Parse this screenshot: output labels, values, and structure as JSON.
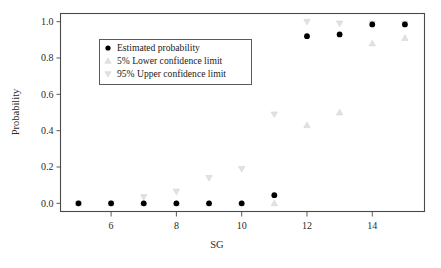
{
  "chart_data": {
    "type": "scatter",
    "title": "",
    "xlabel": "SG",
    "ylabel": "Probability",
    "xlim": [
      4.45,
      15.6
    ],
    "ylim": [
      -0.045,
      1.045
    ],
    "xticks": [
      6,
      8,
      10,
      12,
      14
    ],
    "xtick_labels": [
      "6",
      "8",
      "10",
      "12",
      "14"
    ],
    "yticks": [
      0.0,
      0.2,
      0.4,
      0.6,
      0.8,
      1.0
    ],
    "ytick_labels": [
      "0.0",
      "0.2",
      "0.4",
      "0.6",
      "0.8",
      "1.0"
    ],
    "grid": false,
    "legend_position": "upper left",
    "x": [
      5,
      6,
      7,
      8,
      9,
      10,
      11,
      12,
      13,
      14,
      15
    ],
    "series": [
      {
        "name": "Estimated probability",
        "marker": "filled-circle",
        "color": "#000000",
        "values": [
          0.0,
          0.0,
          0.0,
          0.0,
          0.0,
          0.0,
          0.045,
          0.92,
          0.93,
          0.985,
          0.985
        ]
      },
      {
        "name": "5% Lower confidence limit",
        "marker": "triangle-up",
        "color": "#e2e2e2",
        "values": [
          0.0,
          0.0,
          0.0,
          0.0,
          0.0,
          0.0,
          0.0,
          0.43,
          0.5,
          0.88,
          0.91
        ]
      },
      {
        "name": "95% Upper confidence limit",
        "marker": "triangle-down",
        "color": "#e2e2e2",
        "values": [
          0.0,
          0.0,
          0.035,
          0.065,
          0.14,
          0.19,
          0.49,
          1.0,
          0.99,
          0.99,
          0.99
        ]
      }
    ]
  },
  "legend": {
    "items": [
      {
        "label": "Estimated probability",
        "marker": "filled-circle"
      },
      {
        "label": "5% Lower confidence limit",
        "marker": "triangle-up"
      },
      {
        "label": "95% Upper confidence limit",
        "marker": "triangle-down"
      }
    ]
  },
  "axes": {
    "xlabel": "SG",
    "ylabel": "Probability"
  }
}
